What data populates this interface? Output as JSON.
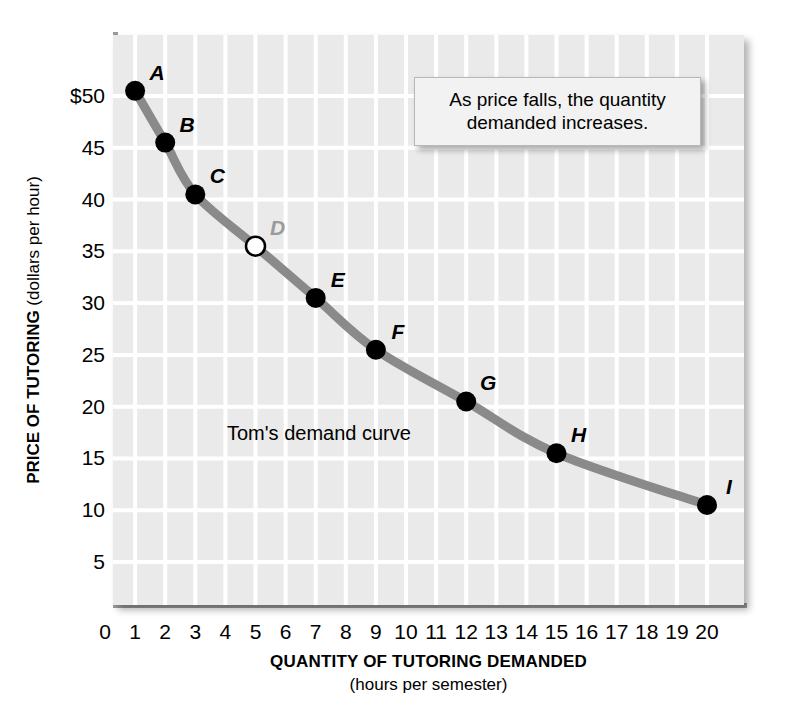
{
  "chart_data": {
    "type": "line",
    "title": "",
    "xlabel": "QUANTITY OF TUTORING DEMANDED",
    "xlabel_sub": "(hours per semester)",
    "ylabel": "PRICE OF TUTORING",
    "ylabel_sub": "(dollars per hour)",
    "xlim": [
      0,
      20
    ],
    "ylim": [
      0,
      55
    ],
    "grid": true,
    "legend": "none",
    "xticks": [
      "0",
      "1",
      "2",
      "3",
      "4",
      "5",
      "6",
      "7",
      "8",
      "9",
      "10",
      "11",
      "12",
      "13",
      "14",
      "15",
      "16",
      "17",
      "18",
      "19",
      "20"
    ],
    "xtick_values": [
      0,
      1,
      2,
      3,
      4,
      5,
      6,
      7,
      8,
      9,
      10,
      11,
      12,
      13,
      14,
      15,
      16,
      17,
      18,
      19,
      20
    ],
    "yticks": [
      "$50",
      "45",
      "40",
      "35",
      "30",
      "25",
      "20",
      "15",
      "10",
      "5"
    ],
    "ytick_values": [
      50,
      45,
      40,
      35,
      30,
      25,
      20,
      15,
      10,
      5
    ],
    "series": [
      {
        "name": "Tom's demand curve",
        "x": [
          1,
          2,
          3,
          5,
          7,
          9,
          12,
          15,
          20
        ],
        "values": [
          50.5,
          45.5,
          40.5,
          35.5,
          30.5,
          25.5,
          20.5,
          15.5,
          10.5
        ],
        "point_labels": [
          "A",
          "B",
          "C",
          "D",
          "E",
          "F",
          "G",
          "H",
          "I"
        ],
        "marker_filled": [
          true,
          true,
          true,
          false,
          true,
          true,
          true,
          true,
          true
        ],
        "color": "#8a8a8a"
      }
    ],
    "curve_label": "Tom's demand curve",
    "annotation": "As price falls, the quantity demanded increases.",
    "colors": {
      "plot_background": "#eaeaea",
      "gridline": "#ffffff",
      "curve": "#8a8a8a",
      "marker_fill": "#000000",
      "open_marker_fill": "#ffffff",
      "muted_label": "#9a9a9a",
      "frame": "#9a9a9a"
    }
  }
}
